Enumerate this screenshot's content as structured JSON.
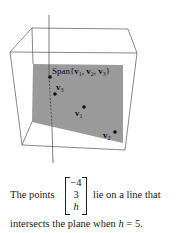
{
  "figure": {
    "plane_label": "Span{v₁, v₂, v₃}",
    "points": [
      {
        "name": "v3",
        "label_base": "v",
        "label_sub": "3"
      },
      {
        "name": "v1",
        "label_base": "v",
        "label_sub": "1"
      },
      {
        "name": "v2",
        "label_base": "v",
        "label_sub": "2"
      }
    ],
    "colors": {
      "plane": "#9a9a9a",
      "box_lines": "#555555",
      "axis_line": "#444444",
      "dots": "#111111"
    }
  },
  "caption": {
    "prefix": "The points",
    "vector": [
      "−4",
      "3",
      "h"
    ],
    "suffix": "lie on a line that",
    "line2_prefix": "intersects the plane when ",
    "line2_var": "h",
    "line2_suffix": " = 5."
  }
}
